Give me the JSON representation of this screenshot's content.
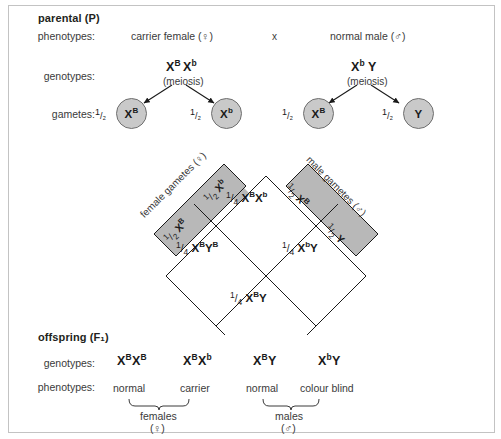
{
  "parental": {
    "section_title": "parental (P)",
    "labels": {
      "phenotypes": "phenotypes:",
      "genotypes": "genotypes:",
      "gametes": "gametes:"
    },
    "cross_symbol": "x",
    "female": {
      "phenotype": "carrier female (♀)",
      "genotype_x1": "X",
      "genotype_sup1": "B",
      "genotype_x2": "X",
      "genotype_sup2": "b",
      "meiosis": "(meiosis)",
      "gametes": [
        {
          "fraction_num": "1",
          "fraction_den": "/₂",
          "allele": "X",
          "sup": "B"
        },
        {
          "fraction_num": "1",
          "fraction_den": "/₂",
          "allele": "X",
          "sup": "b"
        }
      ]
    },
    "male": {
      "phenotype": "normal male (♂)",
      "genotype_x1": "X",
      "genotype_sup1": "b",
      "genotype_x2": "Y",
      "genotype_sup2": "",
      "meiosis": "(meiosis)",
      "gametes": [
        {
          "fraction_num": "1",
          "fraction_den": "/₂",
          "allele": "X",
          "sup": "B"
        },
        {
          "fraction_num": "1",
          "fraction_den": "/₂",
          "allele": "Y",
          "sup": ""
        }
      ]
    }
  },
  "punnett": {
    "axis_female": "female gametes (♀)",
    "axis_male": "male gametes (♂)",
    "bands": {
      "female_lower": {
        "fraction": "1/₂",
        "allele": "X",
        "sup": "B"
      },
      "female_upper": {
        "fraction": "1/₂",
        "allele": "X",
        "sup": "b"
      },
      "male_upper": {
        "fraction": "1/₂",
        "allele": "X",
        "sup": "B"
      },
      "male_lower": {
        "fraction": "1/₂",
        "allele": "Y",
        "sup": ""
      }
    },
    "cells": {
      "top": {
        "fraction": "1/₄",
        "a1": "X",
        "s1": "B",
        "a2": "X",
        "s2": "b"
      },
      "left": {
        "fraction": "1/₄",
        "a1": "X",
        "s1": "B",
        "a2": "Y",
        "s2": "B"
      },
      "right": {
        "fraction": "1/₄",
        "a1": "X",
        "s1": "b",
        "a2": "Y",
        "s2": ""
      },
      "bottom": {
        "fraction": "1/₄",
        "a1": "X",
        "s1": "B",
        "a2": "Y",
        "s2": ""
      }
    },
    "colors": {
      "band_fill": "#b8b8b8",
      "cell_fill": "#ffffff",
      "line": "#1a1a1a"
    }
  },
  "offspring": {
    "section_title": "offspring (F₁)",
    "labels": {
      "genotypes": "genotypes:",
      "phenotypes": "phenotypes:"
    },
    "items": [
      {
        "a1": "X",
        "s1": "B",
        "a2": "X",
        "s2": "B",
        "phenotype": "normal"
      },
      {
        "a1": "X",
        "s1": "B",
        "a2": "X",
        "s2": "b",
        "phenotype": "carrier"
      },
      {
        "a1": "X",
        "s1": "B",
        "a2": "Y",
        "s2": "",
        "phenotype": "normal"
      },
      {
        "a1": "X",
        "s1": "b",
        "a2": "Y",
        "s2": "",
        "phenotype": "colour blind"
      }
    ],
    "groups": [
      {
        "name": "females",
        "symbol": "(♀)"
      },
      {
        "name": "males",
        "symbol": "(♂)"
      }
    ]
  }
}
